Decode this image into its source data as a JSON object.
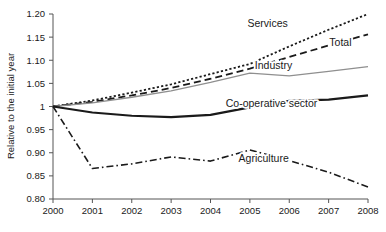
{
  "chart_data": {
    "type": "line",
    "title": "",
    "xlabel": "",
    "ylabel": "Relative to the initial year",
    "x": [
      2000,
      2001,
      2002,
      2003,
      2004,
      2005,
      2006,
      2007,
      2008
    ],
    "xtick_labels": [
      "2000",
      "2001",
      "2002",
      "2003",
      "2004",
      "2005",
      "2006",
      "2007",
      "2008"
    ],
    "xlim": [
      2000,
      2008
    ],
    "ylim": [
      0.8,
      1.2
    ],
    "ytick_labels": [
      "1.20",
      "1.15",
      "1.10",
      "1.05",
      "1",
      "0.95",
      "0.90",
      "0.85",
      "0.80"
    ],
    "ytick_values": [
      1.2,
      1.15,
      1.1,
      1.05,
      1.0,
      0.95,
      0.9,
      0.85,
      0.8
    ],
    "grid": false,
    "legend_position": "inline-labels",
    "series": [
      {
        "name": "Services",
        "style": "dotted",
        "color": "#1a1a1a",
        "width": 1.8,
        "values": [
          1.0,
          1.013,
          1.03,
          1.048,
          1.07,
          1.092,
          1.13,
          1.166,
          1.2
        ],
        "label_x": 2005.45,
        "label_y": 1.172
      },
      {
        "name": "Total",
        "style": "dashed",
        "color": "#1a1a1a",
        "width": 1.8,
        "values": [
          1.0,
          1.01,
          1.024,
          1.04,
          1.06,
          1.082,
          1.107,
          1.132,
          1.156
        ],
        "label_x": 2007.3,
        "label_y": 1.13
      },
      {
        "name": "Industry",
        "style": "solid",
        "color": "#8f8f8f",
        "width": 1.3,
        "values": [
          1.0,
          1.008,
          1.02,
          1.034,
          1.052,
          1.072,
          1.066,
          1.076,
          1.086
        ],
        "label_x": 2005.6,
        "label_y": 1.082
      },
      {
        "name": "Co-operative sector",
        "style": "solid",
        "color": "#1a1a1a",
        "width": 2.2,
        "values": [
          1.0,
          0.987,
          0.98,
          0.977,
          0.982,
          0.998,
          1.012,
          1.015,
          1.024
        ],
        "label_x": 2005.55,
        "label_y": 1.0
      },
      {
        "name": "Agriculture",
        "style": "dashdot",
        "color": "#1a1a1a",
        "width": 1.6,
        "values": [
          1.0,
          0.866,
          0.876,
          0.891,
          0.882,
          0.906,
          0.883,
          0.858,
          0.826
        ],
        "label_x": 2005.35,
        "label_y": 0.879
      }
    ]
  },
  "axes": {
    "y_axis_title": "Relative to the initial year"
  },
  "top_clipped_text": ""
}
